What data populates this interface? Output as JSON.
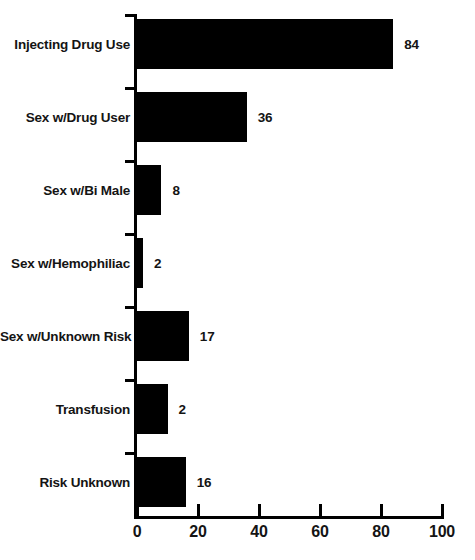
{
  "chart_data": {
    "type": "bar",
    "orientation": "horizontal",
    "title": "",
    "subtitle": "",
    "xlabel": "",
    "ylabel": "",
    "xlim": [
      0,
      100
    ],
    "grid": false,
    "legend": false,
    "legend_position": "none",
    "bar_color": "#000000",
    "background_color": "#ffffff",
    "categories": [
      "Injecting Drug Use",
      "Sex w/Drug User",
      "Sex w/Bi Male",
      "Sex w/Hemophiliac",
      "Sex w/Unknown Risk",
      "Transfusion",
      "Risk Unknown"
    ],
    "values": [
      84,
      36,
      8,
      2,
      17,
      2,
      16
    ],
    "bar_lengths": [
      84,
      36,
      8,
      2,
      17,
      10,
      16
    ],
    "data_labels": [
      "84",
      "36",
      "8",
      "2",
      "17",
      "2",
      "16"
    ],
    "xticks": [
      0,
      20,
      40,
      60,
      80,
      100
    ],
    "xtick_labels": [
      "0",
      "20",
      "40",
      "60",
      "80",
      "100"
    ]
  },
  "bars": [
    {
      "label": "Injecting Drug Use",
      "value_label": "84",
      "length": 84
    },
    {
      "label": "Sex w/Drug User",
      "value_label": "36",
      "length": 36
    },
    {
      "label": "Sex w/Bi Male",
      "value_label": "8",
      "length": 8
    },
    {
      "label": "Sex w/Hemophiliac",
      "value_label": "2",
      "length": 2
    },
    {
      "label": "Sex w/Unknown Risk",
      "value_label": "17",
      "length": 17
    },
    {
      "label": "Transfusion",
      "value_label": "2",
      "length": 10
    },
    {
      "label": "Risk Unknown",
      "value_label": "16",
      "length": 16
    }
  ],
  "xaxis": {
    "ticks": [
      {
        "label": "0",
        "value": 0
      },
      {
        "label": "20",
        "value": 20
      },
      {
        "label": "40",
        "value": 40
      },
      {
        "label": "60",
        "value": 60
      },
      {
        "label": "80",
        "value": 80
      },
      {
        "label": "100",
        "value": 100
      }
    ]
  }
}
